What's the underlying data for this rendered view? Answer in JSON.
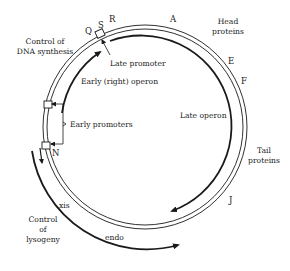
{
  "diagram": {
    "colors": {
      "ink": "#1a1a1a",
      "background": "#ffffff"
    },
    "genes": {
      "Q": "Q",
      "S": "S",
      "R": "R",
      "A": "A",
      "E": "E",
      "F": "F",
      "J": "J",
      "N": "N"
    },
    "regions": {
      "head_line1": "Head",
      "head_line2": "proteins",
      "tail_line1": "Tail",
      "tail_line2": "proteins",
      "dna_line1": "Control of",
      "dna_line2": "DNA synthesis",
      "lyso_line1": "Control",
      "lyso_line2": "of",
      "lyso_line3": "lysogeny"
    },
    "annotations": {
      "late_promoter": "Late promoter",
      "early_right_operon": "Early (right) operon",
      "late_operon": "Late operon",
      "early_promoters": "Early promoters",
      "xis": "xis",
      "endo": "endo"
    }
  }
}
